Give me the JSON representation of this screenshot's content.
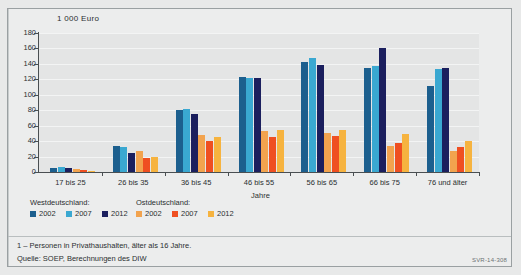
{
  "figure": {
    "code": "SVR-14-308",
    "footnote": "1 – Personen in Privathaushalten, älter als 16 Jahre.",
    "source": "Quelle: SOEP, Berechnungen des DIW"
  },
  "legend": {
    "heading_west": "Westdeutschland:",
    "heading_east": "Ostdeutschland:",
    "entries": [
      {
        "label": "2002",
        "color": "#1c5f8e",
        "region": "west"
      },
      {
        "label": "2007",
        "color": "#3aa8d1",
        "region": "west"
      },
      {
        "label": "2012",
        "color": "#1b1f5e",
        "region": "west"
      },
      {
        "label": "2002",
        "color": "#f2a34e",
        "region": "east"
      },
      {
        "label": "2007",
        "color": "#ef4f21",
        "region": "east"
      },
      {
        "label": "2012",
        "color": "#f6b33f",
        "region": "east"
      }
    ]
  },
  "chart_data": {
    "type": "bar",
    "title": "1 000 Euro",
    "xlabel": "Jahre",
    "ylabel": "1 000 Euro",
    "ylim": [
      0,
      180
    ],
    "yticks": [
      0,
      20,
      40,
      60,
      80,
      100,
      120,
      140,
      160,
      180
    ],
    "grid": true,
    "legend_position": "bottom-left",
    "categories": [
      "17 bis 25",
      "26 bis 35",
      "36 bis 45",
      "46 bis 55",
      "56 bis 65",
      "66 bis 75",
      "76 und älter"
    ],
    "series": [
      {
        "name": "Westdeutschland 2002",
        "color": "#1c5f8e",
        "values": [
          5,
          34,
          80,
          123,
          143,
          135,
          112
        ]
      },
      {
        "name": "Westdeutschland 2007",
        "color": "#3aa8d1",
        "values": [
          6,
          32,
          81,
          122,
          148,
          137,
          133
        ]
      },
      {
        "name": "Westdeutschland 2012",
        "color": "#1b1f5e",
        "values": [
          5,
          25,
          75,
          122,
          138,
          160,
          135
        ]
      },
      {
        "name": "Ostdeutschland 2002",
        "color": "#f2a34e",
        "values": [
          4,
          27,
          48,
          53,
          51,
          34,
          27
        ]
      },
      {
        "name": "Ostdeutschland 2007",
        "color": "#ef4f21",
        "values": [
          3,
          18,
          40,
          45,
          46,
          38,
          33
        ]
      },
      {
        "name": "Ostdeutschland 2012",
        "color": "#f6b33f",
        "values": [
          1,
          20,
          45,
          55,
          55,
          49,
          40
        ]
      }
    ]
  }
}
